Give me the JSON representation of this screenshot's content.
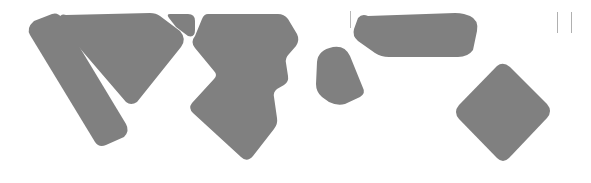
{
  "canvas": {
    "width": 591,
    "height": 183,
    "background_color": "#ffffff",
    "shape_color": "#808080",
    "tick_color": "#b0b0b0",
    "description": "Abstract masked silhouette composition: seven gray rounded geometric blobs and three thin vertical tick marks on a white field"
  },
  "shapes": [
    {
      "id": "shape-1",
      "name": "diagonal-bar-left",
      "kind": "rounded-parallelogram",
      "fill": "#808080",
      "bbox": [
        27,
        12,
        130,
        148
      ],
      "path": "M 34 21 L 52 14 Q 58 12 62 18 L 126 124 Q 130 131 124 137 L 106 145 Q 99 148 95 142 L 30 35 Q 26 28 34 21 Z"
    },
    {
      "id": "shape-2",
      "name": "large-triangle-upper-left",
      "kind": "rounded-triangle",
      "fill": "#808080",
      "bbox": [
        58,
        13,
        185,
        104
      ],
      "path": "M 66 15 Q 60 13 59 20 L 59 24 L 126 102 Q 131 106 137 102 L 181 47 Q 187 39 180 31 L 160 16 Q 156 13 150 13 L 66 15 Z"
    },
    {
      "id": "shape-3",
      "name": "small-wedge-connector",
      "kind": "wedge",
      "fill": "#808080",
      "bbox": [
        168,
        13,
        196,
        40
      ],
      "path": "M 170 14 L 188 14 Q 195 14 195 21 L 195 30 Q 195 38 188 36 L 176 27 L 169 18 Q 166 14 170 14 Z"
    },
    {
      "id": "shape-4",
      "name": "central-polygon-block",
      "kind": "irregular-polygon",
      "fill": "#808080",
      "bbox": [
        190,
        13,
        298,
        170
      ],
      "path": "M 208 14 L 278 14 Q 284 14 288 19 L 297 34 Q 300 40 296 46 L 289 54 Q 285 58 286 63 L 288 76 Q 289 82 284 85 L 277 89 Q 273 92 274 97 L 277 118 Q 278 124 274 129 L 253 156 Q 247 163 241 157 L 193 113 Q 188 108 192 103 L 214 79 Q 218 75 214 71 L 195 48 Q 190 42 195 36 L 202 19 Q 204 14 208 14 Z"
    },
    {
      "id": "shape-5",
      "name": "rounded-blob-center",
      "kind": "rounded-teardrop",
      "fill": "#808080",
      "bbox": [
        316,
        46,
        364,
        105
      ],
      "path": "M 333 47 Q 345 45 350 56 L 363 88 Q 366 93 360 97 L 345 104 Q 337 106 329 102 L 322 97 Q 316 92 316 84 L 317 62 Q 318 50 333 47 Z"
    },
    {
      "id": "shape-6",
      "name": "horizontal-tapered-bar",
      "kind": "rounded-quadrilateral",
      "fill": "#808080",
      "bbox": [
        353,
        13,
        478,
        60
      ],
      "path": "M 368 16 Q 362 13 358 18 L 354 29 Q 352 36 358 41 L 375 53 Q 381 57 389 57 L 458 57 Q 468 57 473 50 L 477 31 Q 479 20 470 16 L 464 14 Q 460 13 455 13 L 368 16 Z"
    },
    {
      "id": "shape-7",
      "name": "rotated-rounded-diamond",
      "kind": "rounded-diamond",
      "fill": "#808080",
      "bbox": [
        455,
        63,
        551,
        162
      ],
      "path": "M 497 66 Q 503 61 510 67 L 547 104 Q 553 111 547 118 L 509 158 Q 503 164 497 158 L 459 119 Q 453 112 459 105 L 497 66 Z"
    }
  ],
  "tick_marks": [
    {
      "id": "tick-1",
      "name": "tick-bar-left-end",
      "x": 350,
      "y1": 11,
      "y2": 28,
      "color": "#b8b8b8",
      "width": 1
    },
    {
      "id": "tick-2",
      "name": "tick-far-right-a",
      "x": 557,
      "y1": 12,
      "y2": 33,
      "color": "#b0b0b0",
      "width": 1
    },
    {
      "id": "tick-3",
      "name": "tick-far-right-b",
      "x": 571,
      "y1": 12,
      "y2": 33,
      "color": "#b0b0b0",
      "width": 1
    }
  ]
}
